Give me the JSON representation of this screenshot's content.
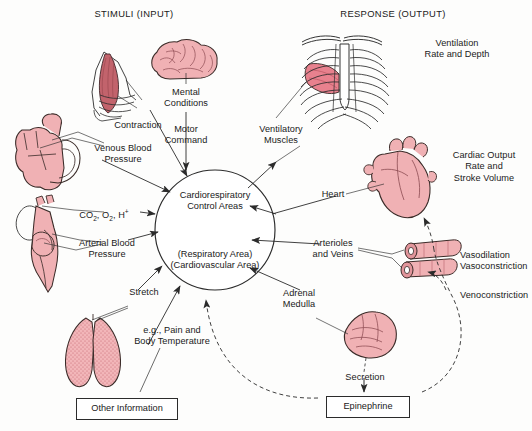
{
  "figure": {
    "headers": {
      "left": "STIMULI (INPUT)",
      "right": "RESPONSE (OUTPUT)"
    },
    "center": {
      "line1": "Cardiorespiratory",
      "line2": "Control Areas",
      "line3": "(Respiratory Area)",
      "line4": "(Cardiovascular Area)"
    },
    "input_labels": [
      {
        "id": "contraction",
        "text": "Contraction"
      },
      {
        "id": "mental-conditions",
        "text": "Mental\nConditions"
      },
      {
        "id": "motor-command",
        "text": "Motor\nCommand"
      },
      {
        "id": "venous-blood-pressure",
        "text": "Venous Blood\nPressure"
      },
      {
        "id": "blood-gases",
        "text": "CO2, O2, H+"
      },
      {
        "id": "arterial-blood-pressure",
        "text": "Arterial Blood\nPressure"
      },
      {
        "id": "stretch",
        "text": "Stretch"
      },
      {
        "id": "pain-temperature",
        "text": "e.g., Pain and\nBody Temperature"
      },
      {
        "id": "other-information",
        "text": "Other Information"
      }
    ],
    "output_labels": [
      {
        "id": "ventilatory-muscles",
        "text": "Ventilatory\nMuscles"
      },
      {
        "id": "ventilation-rate-depth",
        "text": "Ventilation\nRate and Depth"
      },
      {
        "id": "heart",
        "text": "Heart"
      },
      {
        "id": "cardiac-output",
        "text": "Cardiac Output\nRate and\nStroke Volume"
      },
      {
        "id": "arterioles-veins",
        "text": "Arterioles\nand Veins"
      },
      {
        "id": "vasodilation",
        "text": "Vasodilation\nVasoconstriction"
      },
      {
        "id": "venoconstriction",
        "text": "Venoconstriction"
      },
      {
        "id": "adrenal-medulla",
        "text": "Adrenal\nMedulla"
      },
      {
        "id": "secretion",
        "text": "Secretion"
      },
      {
        "id": "epinephrine",
        "text": "Epinephrine"
      }
    ],
    "organs": [
      {
        "id": "skeletal-muscle",
        "name": "Skeletal muscle of arm"
      },
      {
        "id": "brain",
        "name": "Brain"
      },
      {
        "id": "venous-heart",
        "name": "Heart, venous return section"
      },
      {
        "id": "arterial-heart",
        "name": "Heart with aortic arch and baroreceptors"
      },
      {
        "id": "lungs",
        "name": "Lungs"
      },
      {
        "id": "rib-cage",
        "name": "Thoracic rib cage with intercostal muscles"
      },
      {
        "id": "heart-organ",
        "name": "Heart"
      },
      {
        "id": "vessels",
        "name": "Arteriole and vein segments"
      },
      {
        "id": "adrenal-gland",
        "name": "Adrenal gland"
      }
    ],
    "colors": {
      "tissue_fill": "#f0b1b4",
      "tissue_stroke": "#3a2b28",
      "muscle_fill": "#d96f79",
      "highlight_fill": "#e8818e",
      "stroke": "#2b2b2b",
      "text": "#1a1a1a",
      "background": "#ffffff"
    }
  }
}
